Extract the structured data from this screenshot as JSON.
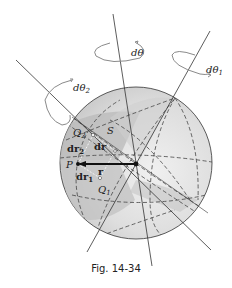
{
  "figure": {
    "caption": "Fig. 14-34",
    "colors": {
      "sphere_fill": "#d9d9d9",
      "sphere_light": "#ececec",
      "sphere_shadow": "#b8b8b8",
      "lines": "#333333",
      "rotation_arrows": "#8a8a8a"
    },
    "labels": {
      "d_theta": "dθ",
      "d_theta_1": "dθ",
      "d_theta_1_sub": "1",
      "d_theta_2": "dθ",
      "d_theta_2_sub": "2",
      "Q2": "Q",
      "Q2_sub": "2",
      "S": "S",
      "dr2": "dr",
      "dr2_sub": "2",
      "dr": "dr",
      "P": "P",
      "r": "r",
      "dr1": "dr",
      "dr1_sub": "1",
      "Q1": "Q",
      "Q1_sub": "1"
    }
  }
}
